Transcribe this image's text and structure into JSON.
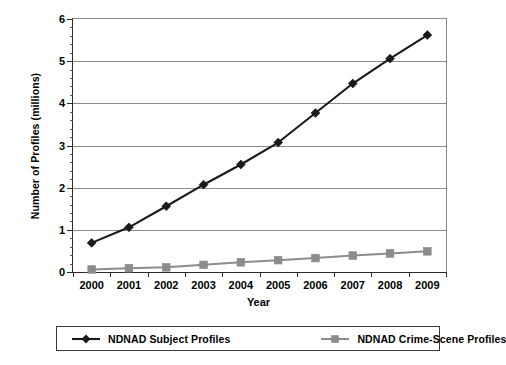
{
  "chart_data": {
    "type": "line",
    "title": "",
    "xlabel": "Year",
    "ylabel": "Number of Profiles (millions)",
    "categories": [
      "2000",
      "2001",
      "2002",
      "2003",
      "2004",
      "2005",
      "2006",
      "2007",
      "2008",
      "2009"
    ],
    "x": [
      2000,
      2001,
      2002,
      2003,
      2004,
      2005,
      2006,
      2007,
      2008,
      2009
    ],
    "ylim": [
      0,
      6
    ],
    "yticks": [
      0,
      1,
      2,
      3,
      4,
      5,
      6
    ],
    "ytick_labels": [
      "0",
      "1",
      "2",
      "3",
      "4",
      "5",
      "6"
    ],
    "y_minor_step": 0.2,
    "grid": "horizontal",
    "legend_position": "bottom",
    "series": [
      {
        "name": "NDNAD Subject Profiles",
        "color": "#1a1a1a",
        "marker": "diamond",
        "values": [
          0.69,
          1.06,
          1.56,
          2.07,
          2.55,
          3.07,
          3.77,
          4.47,
          5.06,
          5.62
        ]
      },
      {
        "name": "NDNAD Crime-Scene Profiles",
        "color": "#8c8c8c",
        "marker": "square",
        "values": [
          0.06,
          0.09,
          0.11,
          0.17,
          0.23,
          0.28,
          0.33,
          0.39,
          0.44,
          0.49
        ]
      }
    ]
  },
  "axes": {
    "y_title": "Number of Profiles (millions)",
    "x_title": "Year"
  },
  "legend": {
    "items": [
      {
        "label": "NDNAD Subject Profiles",
        "color": "#1a1a1a",
        "marker": "diamond"
      },
      {
        "label": "NDNAD Crime-Scene Profiles",
        "color": "#8c8c8c",
        "marker": "square"
      }
    ]
  },
  "colors": {
    "subject_series": "#1a1a1a",
    "crime_scene_series": "#8c8c8c",
    "gridline": "#8c8c8c",
    "axis": "#2a2a2a",
    "background": "#ffffff"
  }
}
